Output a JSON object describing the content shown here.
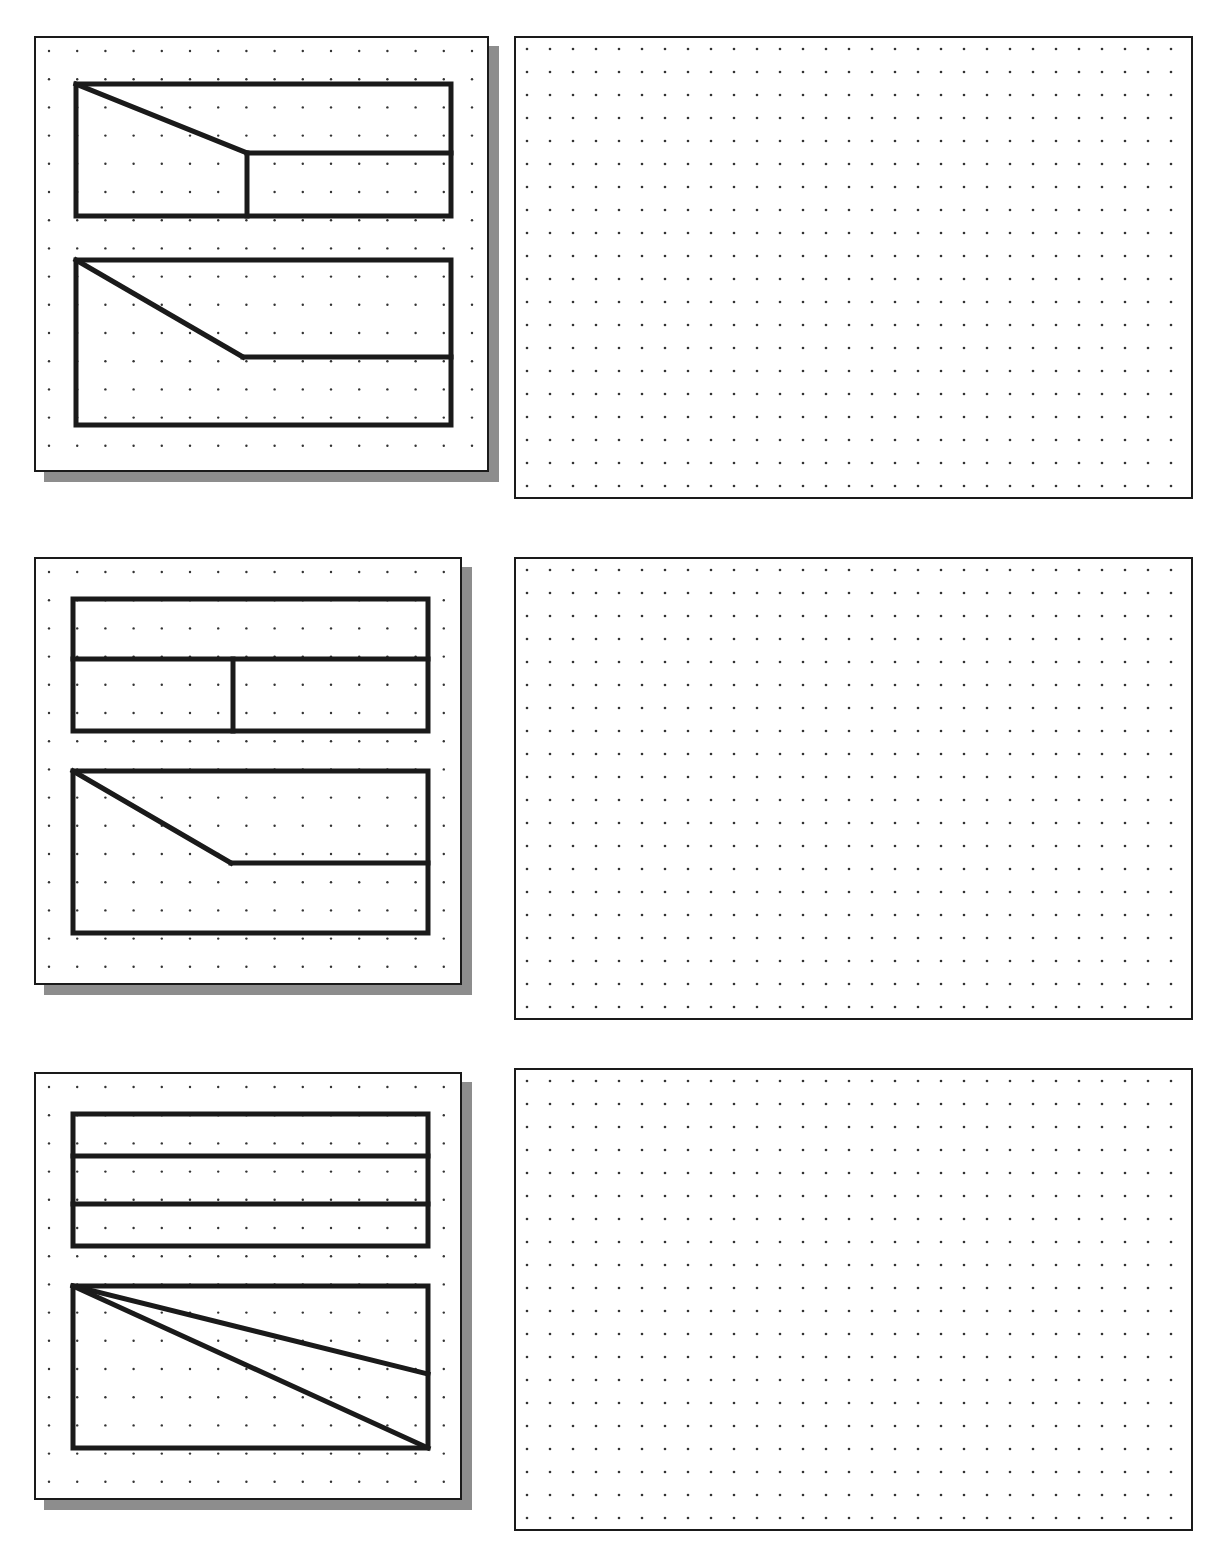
{
  "worksheet": {
    "title": "Orthographic Projection Exercise Sheet",
    "top_text_remnant": "",
    "page_width": 1213,
    "page_height": 1551,
    "ink_color": "#1a1a1a",
    "shadow_color": "#8d8d8d",
    "paper_color": "#ffffff",
    "dot_color": "#333333"
  },
  "given_grid": {
    "label": "given-views-dot-grid",
    "spacing_px": 28.2,
    "origin_x": 13,
    "origin_y": 13,
    "dot_radius": 1.2
  },
  "answer_grid": {
    "label": "answer-isometric-dot-grid",
    "spacing_px": 23.0,
    "origin_x": 11,
    "origin_y": 11,
    "dot_radius": 1.3
  },
  "problems": [
    {
      "id": "problem-1",
      "number": "1",
      "card": {
        "x": 34,
        "y": 36,
        "w": 455,
        "h": 436,
        "shadow_dx": 10,
        "shadow_dy": 10
      },
      "answer_panel": {
        "x": 514,
        "y": 36,
        "w": 679,
        "h": 463
      },
      "views": [
        {
          "name": "top-view",
          "x": 40,
          "y": 46,
          "w": 375,
          "h": 132,
          "description": "Rectangle with a diagonal from the top-left corner down to an interior point, a horizontal line from that point to the right edge, and a vertical line from that point to the bottom edge.",
          "lines": [
            {
              "name": "diagonal-cut",
              "x1": 0,
              "y1": 0,
              "x2": 171,
              "y2": 69
            },
            {
              "name": "horizontal-edge",
              "x1": 171,
              "y1": 69,
              "x2": 375,
              "y2": 69
            },
            {
              "name": "vertical-edge",
              "x1": 171,
              "y1": 69,
              "x2": 171,
              "y2": 132
            }
          ]
        },
        {
          "name": "front-view",
          "x": 40,
          "y": 222,
          "w": 375,
          "h": 165,
          "description": "Rectangle with a diagonal from the top-left corner down-right to an interior point, then a horizontal line from that point to the right edge.",
          "lines": [
            {
              "name": "diagonal-cut",
              "x1": 0,
              "y1": 0,
              "x2": 167,
              "y2": 97
            },
            {
              "name": "horizontal-edge",
              "x1": 167,
              "y1": 97,
              "x2": 375,
              "y2": 97
            }
          ]
        }
      ]
    },
    {
      "id": "problem-2",
      "number": "2",
      "card": {
        "x": 34,
        "y": 557,
        "w": 428,
        "h": 428,
        "shadow_dx": 10,
        "shadow_dy": 10
      },
      "answer_panel": {
        "x": 514,
        "y": 557,
        "w": 679,
        "h": 463
      },
      "views": [
        {
          "name": "top-view",
          "x": 37,
          "y": 40,
          "w": 355,
          "h": 132,
          "description": "Rectangle divided by a full-width horizontal line, with a vertical line in the lower band.",
          "lines": [
            {
              "name": "horizontal-divider",
              "x1": 0,
              "y1": 60,
              "x2": 355,
              "y2": 60
            },
            {
              "name": "vertical-divider",
              "x1": 160,
              "y1": 60,
              "x2": 160,
              "y2": 132
            }
          ]
        },
        {
          "name": "front-view",
          "x": 37,
          "y": 212,
          "w": 355,
          "h": 162,
          "description": "Rectangle with a diagonal from the top-left corner down-right to an interior point, then a horizontal line from that point to the right edge.",
          "lines": [
            {
              "name": "diagonal-cut",
              "x1": 0,
              "y1": 0,
              "x2": 158,
              "y2": 92
            },
            {
              "name": "horizontal-edge",
              "x1": 158,
              "y1": 92,
              "x2": 355,
              "y2": 92
            }
          ]
        }
      ]
    },
    {
      "id": "problem-3",
      "number": "3",
      "card": {
        "x": 34,
        "y": 1072,
        "w": 428,
        "h": 428,
        "shadow_dx": 10,
        "shadow_dy": 10
      },
      "answer_panel": {
        "x": 514,
        "y": 1068,
        "w": 679,
        "h": 463
      },
      "views": [
        {
          "name": "top-view",
          "x": 37,
          "y": 40,
          "w": 355,
          "h": 132,
          "description": "Rectangle divided by two full-width horizontal lines into three bands.",
          "lines": [
            {
              "name": "horizontal-divider-upper",
              "x1": 0,
              "y1": 42,
              "x2": 355,
              "y2": 42
            },
            {
              "name": "horizontal-divider-lower",
              "x1": 0,
              "y1": 90,
              "x2": 355,
              "y2": 90
            }
          ]
        },
        {
          "name": "front-view",
          "x": 37,
          "y": 212,
          "w": 355,
          "h": 162,
          "description": "Rectangle with two diagonals radiating from the top-left corner: one to the bottom-right corner, one to a point on the right edge.",
          "lines": [
            {
              "name": "diagonal-to-right-edge",
              "x1": 0,
              "y1": 0,
              "x2": 355,
              "y2": 88
            },
            {
              "name": "diagonal-to-bottom-right",
              "x1": 0,
              "y1": 0,
              "x2": 355,
              "y2": 162
            }
          ]
        }
      ]
    }
  ]
}
